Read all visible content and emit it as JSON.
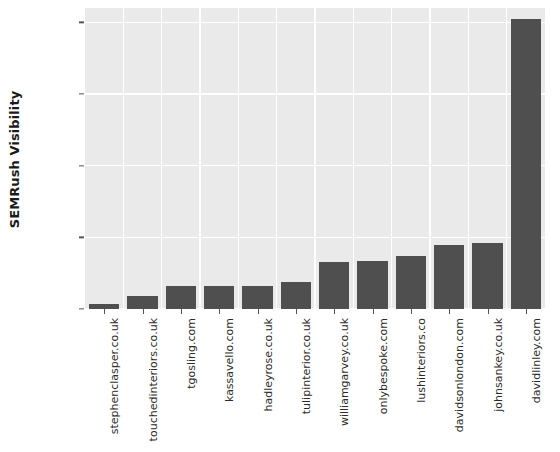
{
  "chart_data": {
    "type": "bar",
    "title": "",
    "subtitle": "",
    "xlabel": "",
    "ylabel": "SEMRush Visibility",
    "ylim": [
      0,
      10500
    ],
    "yticks": [
      0,
      2500,
      5000,
      7500,
      10000
    ],
    "ytick_labels": [
      "0",
      "2500",
      "5000",
      "7500",
      "10000"
    ],
    "grid": true,
    "legend": null,
    "bar_color": "#4f4f4f",
    "plot_background": "#eaeaea",
    "gridline_color": "#ffffff",
    "categories": [
      "stephenclasper.co.uk",
      "touchedinteriors.co.uk",
      "tgosling.com",
      "kassavello.com",
      "hadleyrose.co.uk",
      "tulipinterior.co.uk",
      "williamgarvey.co.uk",
      "onlybespoke.com",
      "lushinteriors.co",
      "davidsonlondon.com",
      "johnsankey.co.uk",
      "davidlinley.com"
    ],
    "values": [
      165,
      460,
      820,
      820,
      820,
      955,
      1645,
      1680,
      1845,
      2235,
      2300,
      10100
    ]
  }
}
